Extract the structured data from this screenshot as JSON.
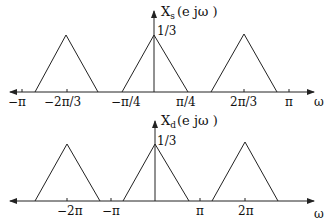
{
  "diagram": {
    "top_plot": {
      "title": "X",
      "title_sub": "s",
      "title_arg": "(e jω  )",
      "peak_label": "1/3",
      "axis_label": "ω",
      "tick_labels": [
        "−π",
        "−2π/3",
        "−π/4",
        "π/4",
        "2π/3",
        "π"
      ],
      "triangles_centers": [
        "−2π/3",
        "0",
        "2π/3"
      ],
      "triangle_half_width": "π/4",
      "peak_value": "1/3"
    },
    "bottom_plot": {
      "title": "X",
      "title_sub": "d",
      "title_arg": "(e jω  )",
      "peak_label": "1/3",
      "axis_label": "ω",
      "tick_labels": [
        "−2π",
        "−π",
        "π",
        "2π"
      ],
      "triangles_centers": [
        "−2π",
        "0",
        "2π"
      ],
      "triangle_half_width": "3π/4",
      "peak_value": "1/3"
    },
    "colors": {
      "line": "#222222",
      "background": "#ffffff"
    }
  }
}
